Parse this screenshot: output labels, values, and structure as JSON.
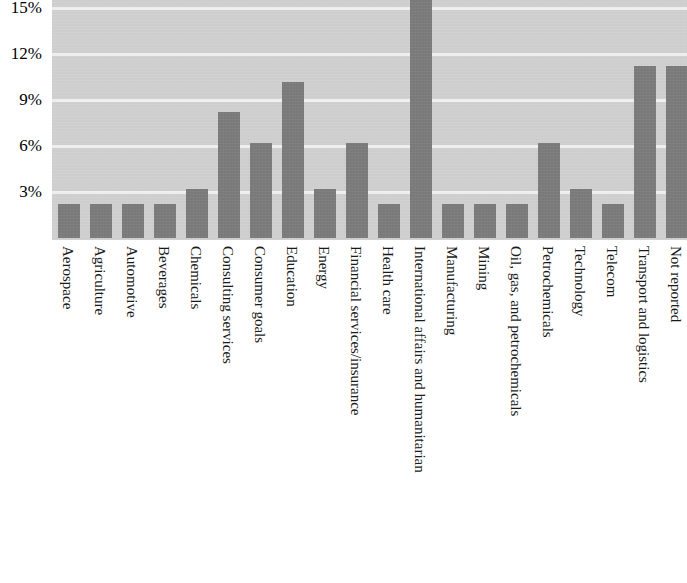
{
  "chart_data": {
    "type": "bar",
    "title": "",
    "subtitle": "",
    "xlabel": "",
    "ylabel": "",
    "ylim": [
      0,
      15
    ],
    "grid": true,
    "legend": null,
    "y_ticks": [
      "15%",
      "12%",
      "9%",
      "6%",
      "3%"
    ],
    "y_tick_values": [
      15,
      12,
      9,
      6,
      3
    ],
    "bar_color": "#7c7c7c",
    "plot_background": "#d2d2d2",
    "gridline_color": "#f2f2f2",
    "note": "Bar for 'International affairs and humanitarian' extends beyond the top of the plot (clipped at 15%).",
    "categories": [
      "Aerospace",
      "Agriculture",
      "Automotive",
      "Beverages",
      "Chemicals",
      "Consulting services",
      "Consumer goals",
      "Education",
      "Energy",
      "Financial services/insurance",
      "Health care",
      "International affairs and humanitarian",
      "Manufacturing",
      "Mining",
      "Oil, gas, and petrochemicals",
      "Petrochemicals",
      "Technology",
      "Telecom",
      "Transport and logistics",
      "Not reported"
    ],
    "values": [
      2.2,
      2.2,
      2.2,
      2.2,
      3.2,
      8.2,
      6.2,
      10.2,
      3.2,
      6.2,
      2.2,
      15.6,
      2.2,
      2.2,
      2.2,
      6.2,
      3.2,
      2.2,
      11.2,
      11.2
    ]
  }
}
